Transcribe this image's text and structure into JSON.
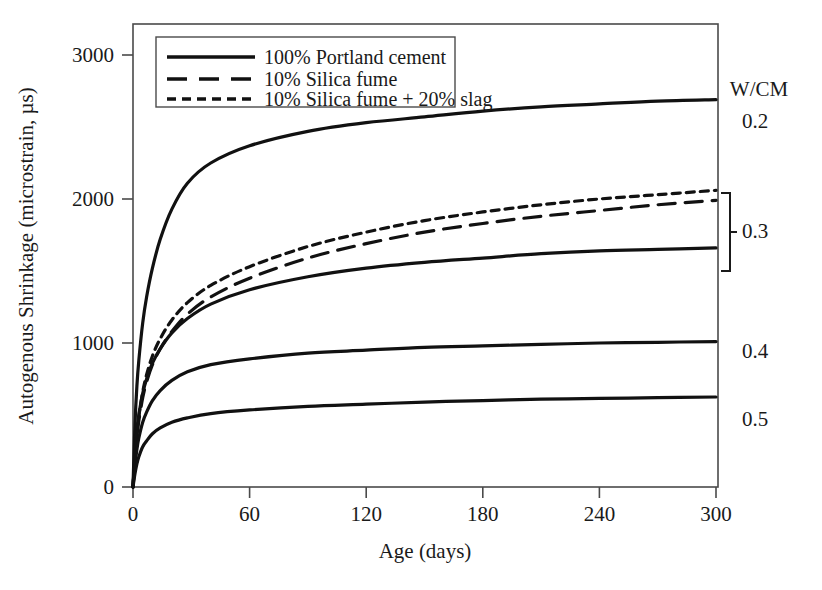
{
  "chart_data": {
    "type": "line",
    "title": "",
    "xlabel": "Age (days)",
    "ylabel": "Autogenous Shrinkage (microstrain, µs)",
    "xlim": [
      0,
      310
    ],
    "ylim": [
      0,
      3300
    ],
    "xticks": [
      0,
      60,
      120,
      180,
      240,
      300
    ],
    "yticks": [
      0,
      1000,
      2000,
      3000
    ],
    "xtick_labels": [
      "0",
      "60",
      "120",
      "180",
      "240",
      "300"
    ],
    "ytick_labels": [
      "0",
      "1000",
      "2000",
      "3000"
    ],
    "grid": false,
    "legend_position": "top-left",
    "x": [
      0,
      1,
      2,
      3,
      5,
      7,
      10,
      14,
      20,
      28,
      40,
      60,
      90,
      120,
      150,
      180,
      210,
      240,
      270,
      300
    ],
    "series": [
      {
        "name": "W/CM 0.2, 100% Portland cement",
        "style": "solid",
        "wcm": "0.2",
        "mixture": "100% Portland cement",
        "values": [
          0,
          430,
          700,
          880,
          1140,
          1320,
          1520,
          1720,
          1930,
          2110,
          2250,
          2370,
          2470,
          2530,
          2570,
          2610,
          2640,
          2660,
          2680,
          2690
        ]
      },
      {
        "name": "W/CM 0.3, 10% Silica fume + 20% slag",
        "style": "dotted",
        "wcm": "0.3",
        "mixture": "10% Silica fume + 20% slag",
        "values": [
          0,
          210,
          370,
          490,
          660,
          780,
          910,
          1030,
          1160,
          1280,
          1400,
          1530,
          1670,
          1770,
          1850,
          1910,
          1960,
          2000,
          2030,
          2060
        ]
      },
      {
        "name": "W/CM 0.3, 10% Silica fume",
        "style": "dashed",
        "wcm": "0.3",
        "mixture": "10% Silica fume",
        "values": [
          0,
          200,
          350,
          460,
          620,
          730,
          850,
          960,
          1080,
          1200,
          1320,
          1450,
          1590,
          1690,
          1770,
          1830,
          1880,
          1920,
          1960,
          1990
        ]
      },
      {
        "name": "W/CM 0.3, 100% Portland cement",
        "style": "solid",
        "wcm": "0.3",
        "mixture": "100% Portland cement",
        "values": [
          0,
          230,
          390,
          500,
          650,
          750,
          860,
          960,
          1070,
          1170,
          1270,
          1370,
          1460,
          1520,
          1560,
          1590,
          1620,
          1640,
          1650,
          1660
        ]
      },
      {
        "name": "W/CM 0.4, 100% Portland cement",
        "style": "solid",
        "wcm": "0.4",
        "mixture": "100% Portland cement",
        "values": [
          0,
          150,
          260,
          340,
          450,
          520,
          600,
          670,
          740,
          800,
          850,
          890,
          930,
          950,
          970,
          980,
          990,
          1000,
          1005,
          1010
        ]
      },
      {
        "name": "W/CM 0.5, 100% Portland cement",
        "style": "solid",
        "wcm": "0.5",
        "mixture": "100% Portland cement",
        "values": [
          0,
          90,
          160,
          210,
          280,
          320,
          370,
          410,
          450,
          480,
          510,
          535,
          560,
          575,
          590,
          600,
          610,
          615,
          620,
          625
        ]
      }
    ],
    "legend_entries": [
      {
        "label": "100% Portland cement",
        "style": "solid"
      },
      {
        "label": "10% Silica fume",
        "style": "dashed"
      },
      {
        "label": "10% Silica fume + 20% slag",
        "style": "dotted"
      }
    ],
    "annotations": {
      "group_header": "W/CM",
      "labels": [
        {
          "text": "0.2",
          "y_value": 2690
        },
        {
          "text": "0.3",
          "y_value": 1860,
          "bracketed": true
        },
        {
          "text": "0.4",
          "y_value": 1010
        },
        {
          "text": "0.5",
          "y_value": 625
        }
      ]
    },
    "colors": {
      "line": "#111111",
      "axis": "#4a4a4a",
      "text": "#1a1a1a",
      "background": "#ffffff"
    }
  }
}
